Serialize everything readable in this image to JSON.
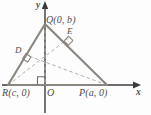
{
  "figure": {
    "axes": {
      "x_label": "x",
      "y_label": "y",
      "origin_label": "O"
    },
    "vertices": [
      {
        "name": "Q",
        "label": "Q(0, b)",
        "x": 0,
        "y": "b",
        "px": 45,
        "py": 24
      },
      {
        "name": "R",
        "label": "R(c, 0)",
        "x": "c",
        "y": 0,
        "px": 8,
        "py": 85
      },
      {
        "name": "P",
        "label": "P(a, 0)",
        "x": "a",
        "y": 0,
        "px": 107,
        "py": 85
      }
    ],
    "feet": [
      {
        "name": "D",
        "label": "D",
        "px": 26,
        "py": 55
      },
      {
        "name": "E",
        "label": "E",
        "px": 70,
        "py": 37
      }
    ],
    "orthocenter": {
      "px": 45,
      "py": 53
    },
    "marks": [
      {
        "type": "right-angle",
        "at": "D"
      },
      {
        "type": "right-angle",
        "at": "E"
      },
      {
        "type": "right-angle",
        "at": "origin-foot"
      }
    ],
    "colors": {
      "triangle_stroke": "#8a857f",
      "axis_stroke": "#3b3b3b",
      "dashed_stroke": "#b0aba6",
      "label_text": "#4d4d4d",
      "background": "#fdfdfd"
    }
  }
}
